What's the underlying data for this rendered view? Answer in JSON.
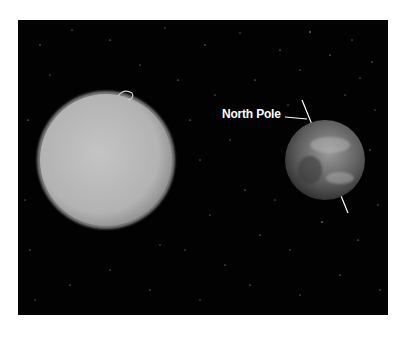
{
  "scene": {
    "description": "Sun and Earth in space with Earth's tilted axis",
    "background_color": "#020202",
    "frame_color": "#ffffff"
  },
  "sun": {
    "name": "sun",
    "color": "#b8b8b8",
    "center": [
      106,
      160
    ],
    "radius": 67
  },
  "earth": {
    "name": "earth",
    "center": [
      325,
      160
    ],
    "radius": 40
  },
  "annotation": {
    "label": "North Pole",
    "color": "#ffffff"
  },
  "axis": {
    "color": "#ffffff",
    "north_end": [
      302,
      100
    ],
    "south_end": [
      348,
      213
    ]
  }
}
